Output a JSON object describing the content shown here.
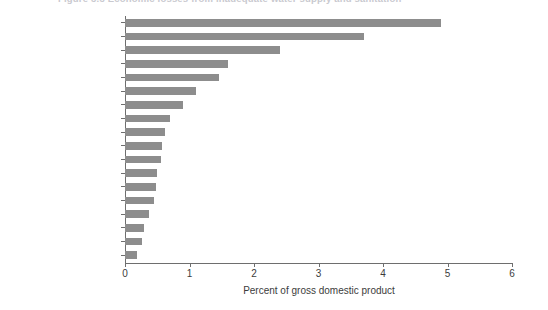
{
  "figure": {
    "caption": "Figure 3.3  Economic losses from inadequate water supply and sanitation"
  },
  "chart_data": {
    "type": "bar",
    "orientation": "horizontal",
    "title": "Figure 3.3  Economic losses from inadequate water supply and sanitation",
    "xlabel": "Percent of gross domestic product",
    "ylabel": "",
    "xlim": [
      0,
      6
    ],
    "xticks": [
      "0",
      "1",
      "2",
      "3",
      "4",
      "5",
      "6"
    ],
    "grid": false,
    "legend": false,
    "bar_color": "#8d8d8d",
    "categories": [
      "Libya",
      "Yemen, Rep.",
      "Iraq",
      "West Bank and Gaza",
      "Djibouti",
      "Algeria",
      "Tunisia",
      "Oman",
      "Egypt, Arab Rep.",
      "Morocco",
      "Saudi Arabia",
      "Kuwait",
      "United Arab Emirates",
      "Iran, Islamic Rep.",
      "Jordan",
      "Israel",
      "Qatar",
      "Lebanon"
    ],
    "values": [
      4.9,
      3.7,
      2.4,
      1.6,
      1.45,
      1.1,
      0.9,
      0.7,
      0.62,
      0.58,
      0.56,
      0.5,
      0.48,
      0.45,
      0.37,
      0.3,
      0.27,
      0.18
    ]
  }
}
